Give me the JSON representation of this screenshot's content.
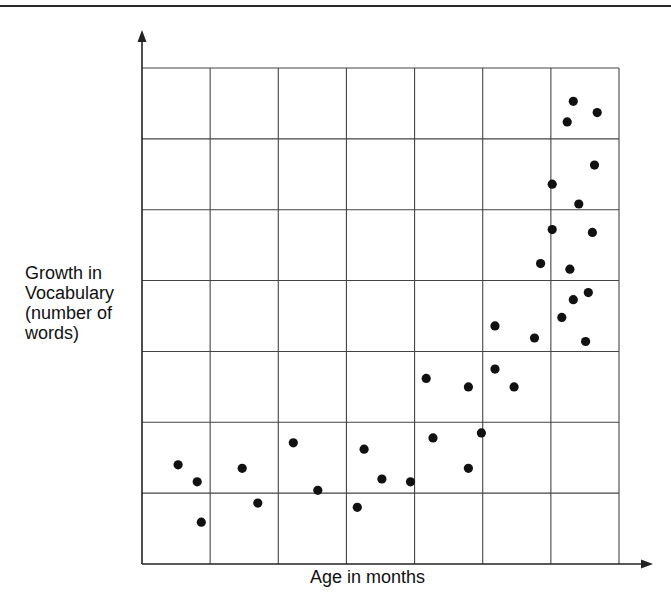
{
  "chart_data": {
    "type": "scatter",
    "title": "",
    "xlabel": "Age in months",
    "ylabel": "Growth in Vocabulary (number of words)",
    "ylabel_lines": [
      "Growth in",
      "Vocabulary",
      "(number of",
      "words)"
    ],
    "xlim": [
      0,
      7
    ],
    "ylim": [
      0,
      7
    ],
    "x_ticks": [],
    "y_ticks": [],
    "grid": true,
    "grid_cols": 7,
    "grid_rows": 7,
    "legend": null,
    "axis_arrows": true,
    "marker_color": "#111111",
    "grid_color": "#444444",
    "series": [
      {
        "name": "observations",
        "points": [
          {
            "x": 0.53,
            "y": 1.4
          },
          {
            "x": 0.81,
            "y": 1.16
          },
          {
            "x": 0.87,
            "y": 0.59
          },
          {
            "x": 1.47,
            "y": 1.35
          },
          {
            "x": 1.7,
            "y": 0.86
          },
          {
            "x": 2.22,
            "y": 1.71
          },
          {
            "x": 2.58,
            "y": 1.04
          },
          {
            "x": 3.16,
            "y": 0.8
          },
          {
            "x": 3.26,
            "y": 1.62
          },
          {
            "x": 3.52,
            "y": 1.2
          },
          {
            "x": 3.94,
            "y": 1.16
          },
          {
            "x": 4.17,
            "y": 2.62
          },
          {
            "x": 4.27,
            "y": 1.78
          },
          {
            "x": 4.79,
            "y": 2.5
          },
          {
            "x": 4.79,
            "y": 1.35
          },
          {
            "x": 4.98,
            "y": 1.85
          },
          {
            "x": 5.18,
            "y": 2.75
          },
          {
            "x": 5.18,
            "y": 3.36
          },
          {
            "x": 5.46,
            "y": 2.5
          },
          {
            "x": 5.76,
            "y": 3.19
          },
          {
            "x": 5.85,
            "y": 4.24
          },
          {
            "x": 6.02,
            "y": 4.72
          },
          {
            "x": 6.02,
            "y": 5.36
          },
          {
            "x": 6.16,
            "y": 3.48
          },
          {
            "x": 6.24,
            "y": 6.24
          },
          {
            "x": 6.28,
            "y": 4.16
          },
          {
            "x": 6.33,
            "y": 6.53
          },
          {
            "x": 6.33,
            "y": 3.73
          },
          {
            "x": 6.41,
            "y": 5.08
          },
          {
            "x": 6.51,
            "y": 3.14
          },
          {
            "x": 6.55,
            "y": 3.83
          },
          {
            "x": 6.61,
            "y": 4.68
          },
          {
            "x": 6.64,
            "y": 5.63
          },
          {
            "x": 6.68,
            "y": 6.37
          }
        ]
      }
    ]
  }
}
